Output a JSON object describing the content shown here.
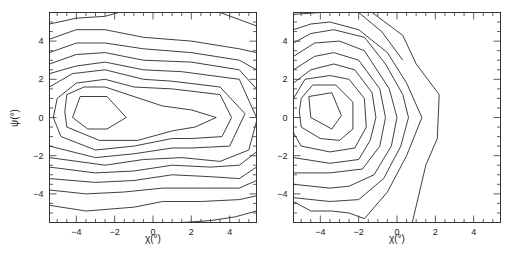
{
  "chart_data": [
    {
      "type": "contour",
      "panel": "left",
      "title": "",
      "xlabel": "χ(°)",
      "ylabel": "ψ(°)",
      "xlim": [
        -5.4,
        5.4
      ],
      "ylim": [
        -5.5,
        5.5
      ],
      "xticks": [
        -4,
        -2,
        0,
        2,
        4
      ],
      "yticks": [
        -4,
        -2,
        0,
        2,
        4
      ],
      "grid": false,
      "contours": [
        [
          [
            -3.8,
            1.1
          ],
          [
            -2.4,
            1.1
          ],
          [
            -1.4,
            0
          ],
          [
            -2.4,
            -0.6
          ],
          [
            -3.4,
            -0.6
          ],
          [
            -4.2,
            0
          ],
          [
            -3.8,
            1.1
          ]
        ],
        [
          [
            -4.5,
            1.2
          ],
          [
            -3.6,
            1.6
          ],
          [
            -2.5,
            1.6
          ],
          [
            -1.3,
            1.2
          ],
          [
            0.5,
            0.6
          ],
          [
            2.0,
            0.4
          ],
          [
            3.3,
            0
          ],
          [
            2.2,
            -0.5
          ],
          [
            1.0,
            -0.7
          ],
          [
            -0.8,
            -1.2
          ],
          [
            -2.8,
            -1.2
          ],
          [
            -4.5,
            -0.5
          ],
          [
            -4.6,
            0.3
          ],
          [
            -4.5,
            1.2
          ]
        ],
        [
          [
            -5.0,
            1.0
          ],
          [
            -4.0,
            1.8
          ],
          [
            -2.5,
            2.0
          ],
          [
            -1.0,
            1.6
          ],
          [
            1.0,
            1.5
          ],
          [
            3.5,
            1.2
          ],
          [
            4.1,
            0
          ],
          [
            3.6,
            -1.0
          ],
          [
            2.0,
            -1.1
          ],
          [
            1.0,
            -1.1
          ],
          [
            -1.0,
            -1.5
          ],
          [
            -3.0,
            -1.7
          ],
          [
            -4.8,
            -1.0
          ],
          [
            -5.2,
            0
          ],
          [
            -5.0,
            1.0
          ]
        ],
        [
          [
            -5.4,
            1.6
          ],
          [
            -4.2,
            2.3
          ],
          [
            -2.5,
            2.5
          ],
          [
            -0.5,
            2.0
          ],
          [
            1.0,
            1.9
          ],
          [
            3.5,
            1.6
          ],
          [
            4.8,
            0.2
          ],
          [
            4.0,
            -1.5
          ],
          [
            2.0,
            -1.6
          ],
          [
            1.0,
            -1.6
          ],
          [
            -1.0,
            -1.9
          ],
          [
            -3.0,
            -2.1
          ],
          [
            -5.4,
            -1.5
          ]
        ],
        [
          [
            -5.4,
            2.3
          ],
          [
            -4.0,
            2.7
          ],
          [
            -2.5,
            2.9
          ],
          [
            -0.5,
            2.5
          ],
          [
            1.5,
            2.4
          ],
          [
            4.5,
            2.0
          ],
          [
            5.4,
            0.0
          ]
        ],
        [
          [
            5.4,
            -0.2
          ],
          [
            5.0,
            -1.7
          ],
          [
            3.5,
            -2.3
          ],
          [
            1.5,
            -2.1
          ],
          [
            -0.5,
            -2.2
          ],
          [
            -2.5,
            -2.5
          ],
          [
            -5.4,
            -2.1
          ]
        ],
        [
          [
            -5.4,
            2.8
          ],
          [
            -4.0,
            3.3
          ],
          [
            -2.5,
            3.4
          ],
          [
            -0.5,
            3.0
          ],
          [
            2.0,
            2.9
          ],
          [
            4.5,
            2.5
          ],
          [
            5.4,
            1.5
          ]
        ],
        [
          [
            5.4,
            -1.8
          ],
          [
            4.5,
            -2.5
          ],
          [
            3.0,
            -2.6
          ],
          [
            1.0,
            -2.5
          ],
          [
            -1.0,
            -2.8
          ],
          [
            -3.0,
            -2.9
          ],
          [
            -5.4,
            -2.6
          ]
        ],
        [
          [
            -5.4,
            3.4
          ],
          [
            -4.0,
            3.9
          ],
          [
            -2.5,
            3.9
          ],
          [
            -0.5,
            3.6
          ],
          [
            2.0,
            3.4
          ],
          [
            4.5,
            3.0
          ],
          [
            5.4,
            2.5
          ]
        ],
        [
          [
            5.4,
            -2.6
          ],
          [
            4.5,
            -3.2
          ],
          [
            3.0,
            -3.1
          ],
          [
            1.0,
            -3.0
          ],
          [
            -1.0,
            -3.3
          ],
          [
            -3.0,
            -3.4
          ],
          [
            -5.4,
            -3.2
          ]
        ],
        [
          [
            -5.4,
            4.1
          ],
          [
            -4.0,
            4.6
          ],
          [
            -2.5,
            4.6
          ],
          [
            -0.5,
            4.2
          ],
          [
            2.0,
            4.0
          ],
          [
            4.5,
            3.6
          ],
          [
            5.4,
            3.4
          ]
        ],
        [
          [
            5.4,
            -3.3
          ],
          [
            4.5,
            -3.7
          ],
          [
            2.5,
            -3.7
          ],
          [
            0.5,
            -3.7
          ],
          [
            -1.5,
            -3.9
          ],
          [
            -3.5,
            -4.0
          ],
          [
            -5.4,
            -3.8
          ]
        ],
        [
          [
            -5.4,
            4.9
          ],
          [
            -4.0,
            5.2
          ],
          [
            -2.5,
            5.3
          ],
          [
            -1.8,
            5.5
          ]
        ],
        [
          [
            5.4,
            -4.1
          ],
          [
            4.5,
            -4.3
          ],
          [
            2.5,
            -4.4
          ],
          [
            0.5,
            -4.4
          ],
          [
            -1.0,
            -4.7
          ],
          [
            -3.5,
            -4.9
          ],
          [
            -5.4,
            -4.6
          ]
        ],
        [
          [
            3.5,
            5.5
          ],
          [
            5.4,
            4.8
          ]
        ],
        [
          [
            5.4,
            -4.9
          ],
          [
            4.3,
            -5.2
          ],
          [
            3.0,
            -5.4
          ],
          [
            1.5,
            -5.5
          ]
        ]
      ]
    },
    {
      "type": "contour",
      "panel": "right",
      "title": "",
      "xlabel": "χ(°)",
      "ylabel": "",
      "xlim": [
        -5.4,
        5.4
      ],
      "ylim": [
        -5.5,
        5.5
      ],
      "xticks": [
        -4,
        -2,
        0,
        2,
        4
      ],
      "yticks": [
        -4,
        -2,
        0,
        2,
        4
      ],
      "grid": false,
      "contours": [
        [
          [
            -4.6,
            1.1
          ],
          [
            -3.4,
            1.3
          ],
          [
            -2.9,
            0.1
          ],
          [
            -3.4,
            -0.6
          ],
          [
            -4.5,
            0
          ],
          [
            -4.6,
            1.1
          ]
        ],
        [
          [
            -5.0,
            1.0
          ],
          [
            -4.4,
            1.7
          ],
          [
            -3.2,
            1.7
          ],
          [
            -2.3,
            0.8
          ],
          [
            -2.3,
            -0.6
          ],
          [
            -3.0,
            -1.2
          ],
          [
            -4.0,
            -1.1
          ],
          [
            -5.0,
            -0.5
          ],
          [
            -5.1,
            0.3
          ],
          [
            -5.0,
            1.0
          ]
        ],
        [
          [
            -5.4,
            1.0
          ],
          [
            -4.8,
            2.0
          ],
          [
            -3.5,
            2.2
          ],
          [
            -2.5,
            2.0
          ],
          [
            -1.7,
            1.0
          ],
          [
            -1.6,
            -0.5
          ],
          [
            -2.2,
            -1.6
          ],
          [
            -3.5,
            -1.8
          ],
          [
            -5.0,
            -1.5
          ],
          [
            -5.4,
            -0.8
          ]
        ],
        [
          [
            -5.4,
            1.8
          ],
          [
            -4.5,
            2.5
          ],
          [
            -3.3,
            2.8
          ],
          [
            -2.2,
            2.5
          ],
          [
            -1.3,
            1.3
          ],
          [
            -1.1,
            0
          ],
          [
            -1.4,
            -1.2
          ],
          [
            -2.0,
            -2.2
          ],
          [
            -3.5,
            -2.4
          ],
          [
            -5.4,
            -2.1
          ]
        ],
        [
          [
            -5.4,
            2.5
          ],
          [
            -4.3,
            3.2
          ],
          [
            -3.3,
            3.4
          ],
          [
            -2.0,
            3.0
          ],
          [
            -0.9,
            1.5
          ],
          [
            -0.6,
            0
          ],
          [
            -0.9,
            -1.5
          ],
          [
            -1.8,
            -2.7
          ],
          [
            -3.5,
            -2.9
          ],
          [
            -5.4,
            -2.9
          ]
        ],
        [
          [
            -5.4,
            3.2
          ],
          [
            -4.3,
            3.9
          ],
          [
            -3.0,
            4.0
          ],
          [
            -1.7,
            3.5
          ],
          [
            -0.4,
            1.5
          ],
          [
            0.0,
            0
          ],
          [
            -0.3,
            -1.5
          ],
          [
            -1.2,
            -3.0
          ],
          [
            -2.5,
            -3.6
          ],
          [
            -3.5,
            -3.7
          ],
          [
            -5.4,
            -3.5
          ]
        ],
        [
          [
            -5.4,
            3.9
          ],
          [
            -4.5,
            4.4
          ],
          [
            -3.3,
            4.6
          ],
          [
            -1.7,
            4.2
          ],
          [
            -0.6,
            2.8
          ],
          [
            0.3,
            1.2
          ],
          [
            0.6,
            0
          ],
          [
            0.2,
            -1.5
          ],
          [
            -0.7,
            -3.2
          ],
          [
            -2.0,
            -4.3
          ],
          [
            -3.5,
            -4.4
          ],
          [
            -5.4,
            -4.2
          ]
        ],
        [
          [
            -5.4,
            4.6
          ],
          [
            -4.5,
            4.9
          ],
          [
            -3.5,
            5.0
          ],
          [
            -2.0,
            4.6
          ],
          [
            -0.5,
            3.4
          ],
          [
            0.5,
            1.8
          ],
          [
            1.3,
            0
          ],
          [
            0.5,
            -2.0
          ],
          [
            -0.5,
            -3.9
          ],
          [
            -1.7,
            -5.3
          ],
          [
            -2.5,
            -5.0
          ],
          [
            -3.4,
            -4.9
          ],
          [
            -4.5,
            -4.9
          ],
          [
            -5.4,
            -4.4
          ]
        ],
        [
          [
            -5.4,
            5.4
          ],
          [
            -4.0,
            5.5
          ]
        ],
        [
          [
            -1.3,
            5.5
          ],
          [
            0.3,
            4.3
          ],
          [
            1.0,
            2.8
          ],
          [
            2.2,
            1.2
          ],
          [
            2.1,
            -1.1
          ],
          [
            1.5,
            -2.5
          ],
          [
            0.8,
            -5.5
          ]
        ],
        [
          [
            -2.0,
            5.5
          ],
          [
            -0.8,
            4.5
          ],
          [
            0.3,
            3.0
          ]
        ]
      ]
    }
  ],
  "axes": {
    "left": {
      "xlabel": "χ(°)",
      "ylabel": "ψ(°)",
      "xticklabels": [
        "-4",
        "-2",
        "0",
        "2",
        "4"
      ],
      "yticklabels": [
        "4",
        "2",
        "0",
        "-2",
        "-4"
      ]
    },
    "right": {
      "xlabel": "χ(°)",
      "xticklabels": [
        "-4",
        "-2",
        "0",
        "2",
        "4"
      ],
      "yticklabels": [
        "4",
        "2",
        "0",
        "-2",
        "-4"
      ]
    }
  },
  "colors": {
    "line": "#2a2a2a",
    "frame": "#333333",
    "background": "#ffffff"
  }
}
